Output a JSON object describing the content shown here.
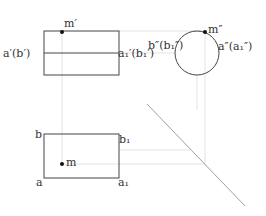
{
  "diagram": {
    "colors": {
      "outline": "#444444",
      "construction": "#d8d8d8",
      "diagonal": "#a0a0a0",
      "point": "#111111"
    },
    "front_view": {
      "rect": {
        "x": 44,
        "y": 31,
        "w": 75,
        "h": 44
      },
      "axis_y": 53,
      "labels": {
        "left": "a′(b′)",
        "right": "a₁′(b₁′)",
        "point": "m′"
      },
      "point": {
        "x": 62,
        "y": 32
      }
    },
    "side_view": {
      "circle": {
        "cx": 197,
        "cy": 53,
        "r": 22
      },
      "labels": {
        "left": "b″(b₁″)",
        "right": "a″(a₁″)",
        "point": "m″"
      },
      "point": {
        "x": 205,
        "y": 32
      }
    },
    "top_view": {
      "rect": {
        "x": 44,
        "y": 134,
        "w": 75,
        "h": 44
      },
      "labels": {
        "top_left": "b",
        "top_right": "b₁",
        "bottom_left": "a",
        "bottom_right": "a₁",
        "point": "m"
      },
      "point": {
        "x": 62,
        "y": 164
      }
    },
    "diagonal_45": {
      "x1": 147,
      "y1": 104,
      "x2": 245,
      "y2": 206
    }
  }
}
